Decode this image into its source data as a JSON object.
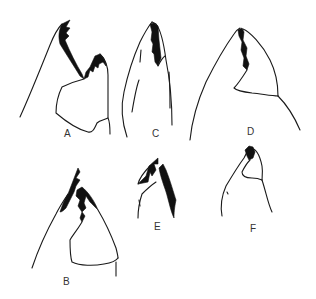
{
  "figure": {
    "panels": [
      {
        "id": "A",
        "label": "A"
      },
      {
        "id": "B",
        "label": "B"
      },
      {
        "id": "C",
        "label": "C"
      },
      {
        "id": "D",
        "label": "D"
      },
      {
        "id": "E",
        "label": "E"
      },
      {
        "id": "F",
        "label": "F"
      }
    ]
  },
  "colors": {
    "background": "#ffffff",
    "ink": "#111111",
    "label": "#333333"
  }
}
